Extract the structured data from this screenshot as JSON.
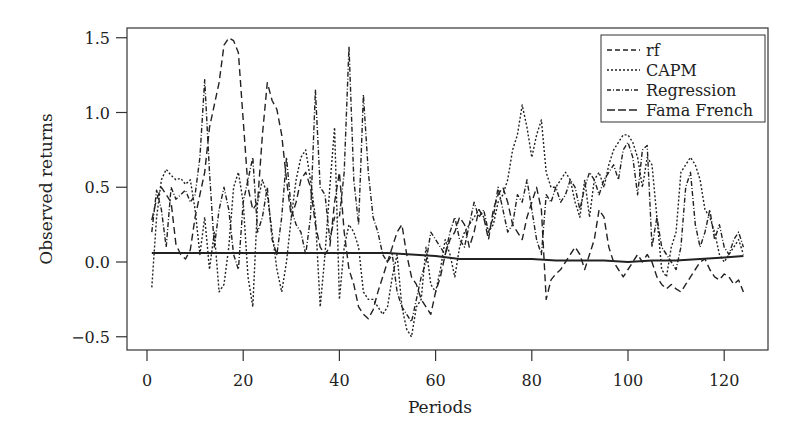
{
  "chart_data": {
    "type": "line",
    "title": "",
    "xlabel": "Periods",
    "ylabel": "Observed returns",
    "xlim": [
      -4,
      129
    ],
    "ylim": [
      -0.6,
      1.58
    ],
    "x_ticks": [
      0,
      20,
      40,
      60,
      80,
      100,
      120
    ],
    "x_tick_labels": [
      "0",
      "20",
      "40",
      "60",
      "80",
      "100",
      "120"
    ],
    "y_ticks": [
      -0.5,
      0.0,
      0.5,
      1.0,
      1.5
    ],
    "y_tick_labels": [
      "−0.5",
      "0.0",
      "0.5",
      "1.0",
      "1.5"
    ],
    "grid": false,
    "legend_position": "top-right",
    "series": [
      {
        "name": "rf",
        "dash": "7,4",
        "x": [
          1,
          2,
          3,
          4,
          5,
          6,
          7,
          8,
          9,
          10,
          11,
          12,
          13,
          14,
          15,
          16,
          17,
          18,
          19,
          20,
          21,
          22,
          23,
          24,
          25,
          26,
          27,
          28,
          29,
          30,
          31,
          32,
          33,
          34,
          35,
          36,
          37,
          38,
          39,
          40,
          41,
          42,
          43,
          44,
          45,
          46,
          47,
          48,
          49,
          50,
          51,
          52,
          53,
          54,
          55,
          56,
          57,
          58,
          59,
          60,
          61,
          62,
          63,
          64,
          65,
          66,
          67,
          68,
          69,
          70,
          71,
          72,
          73,
          74,
          75,
          76,
          77,
          78,
          79,
          80,
          81,
          82,
          83,
          84,
          85,
          86,
          87,
          88,
          89,
          90,
          91,
          92,
          93,
          94,
          95,
          96,
          97,
          98,
          99,
          100,
          101,
          102,
          103,
          104,
          105,
          106,
          107,
          108,
          109,
          110,
          111,
          112,
          113,
          114,
          115,
          116,
          117,
          118,
          119,
          120,
          121,
          122,
          123,
          124
        ],
        "values": [
          0.28,
          0.42,
          0.5,
          0.45,
          0.4,
          0.12,
          0.05,
          0.02,
          0.08,
          0.3,
          0.45,
          0.6,
          0.9,
          1.05,
          1.2,
          1.45,
          1.5,
          1.48,
          1.4,
          0.95,
          0.5,
          0.35,
          0.4,
          0.85,
          1.2,
          1.08,
          1.02,
          0.85,
          0.55,
          0.3,
          0.4,
          0.55,
          0.6,
          0.5,
          0.25,
          0.1,
          0.05,
          0.1,
          0.4,
          0.6,
          0.2,
          -0.05,
          -0.15,
          -0.3,
          -0.35,
          -0.38,
          -0.32,
          -0.2,
          -0.1,
          0.0,
          0.1,
          0.2,
          0.25,
          0.05,
          -0.1,
          -0.15,
          -0.25,
          -0.3,
          -0.35,
          -0.2,
          -0.1,
          0.05,
          0.15,
          0.2,
          0.3,
          0.25,
          0.1,
          0.2,
          0.35,
          0.3,
          0.15,
          0.35,
          0.45,
          0.5,
          0.4,
          0.25,
          0.2,
          0.15,
          0.3,
          0.4,
          0.5,
          0.35,
          -0.25,
          -0.12,
          -0.08,
          -0.05,
          0.0,
          0.05,
          0.1,
          0.05,
          -0.05,
          0.05,
          0.15,
          0.35,
          0.3,
          0.1,
          0.0,
          -0.05,
          -0.1,
          -0.05,
          0.0,
          0.05,
          0.0,
          0.05,
          0.0,
          -0.1,
          -0.15,
          -0.18,
          -0.15,
          -0.18,
          -0.2,
          -0.15,
          -0.1,
          -0.05,
          0.0,
          0.02,
          -0.05,
          -0.1,
          -0.12,
          -0.08,
          -0.1,
          -0.15,
          -0.12,
          -0.2
        ]
      },
      {
        "name": "CAPM",
        "dash": "2,2",
        "x": [
          1,
          2,
          3,
          4,
          5,
          6,
          7,
          8,
          9,
          10,
          11,
          12,
          13,
          14,
          15,
          16,
          17,
          18,
          19,
          20,
          21,
          22,
          23,
          24,
          25,
          26,
          27,
          28,
          29,
          30,
          31,
          32,
          33,
          34,
          35,
          36,
          37,
          38,
          39,
          40,
          41,
          42,
          43,
          44,
          45,
          46,
          47,
          48,
          49,
          50,
          51,
          52,
          53,
          54,
          55,
          56,
          57,
          58,
          59,
          60,
          61,
          62,
          63,
          64,
          65,
          66,
          67,
          68,
          69,
          70,
          71,
          72,
          73,
          74,
          75,
          76,
          77,
          78,
          79,
          80,
          81,
          82,
          83,
          84,
          85,
          86,
          87,
          88,
          89,
          90,
          91,
          92,
          93,
          94,
          95,
          96,
          97,
          98,
          99,
          100,
          101,
          102,
          103,
          104,
          105,
          106,
          107,
          108,
          109,
          110,
          111,
          112,
          113,
          114,
          115,
          116,
          117,
          118,
          119,
          120,
          121,
          122,
          123,
          124
        ],
        "values": [
          -0.17,
          0.3,
          0.55,
          0.62,
          0.58,
          0.55,
          0.56,
          0.52,
          0.55,
          0.35,
          0.05,
          0.3,
          -0.05,
          0.2,
          -0.2,
          -0.15,
          0.1,
          0.5,
          0.6,
          0.4,
          -0.1,
          -0.3,
          0.4,
          0.55,
          0.45,
          0.2,
          -0.05,
          -0.2,
          0.0,
          0.3,
          0.55,
          0.7,
          0.75,
          0.55,
          0.3,
          -0.3,
          0.05,
          0.5,
          0.9,
          -0.25,
          0.1,
          0.25,
          0.2,
          0.1,
          -0.2,
          -0.25,
          -0.25,
          -0.3,
          -0.35,
          -0.3,
          -0.1,
          0.05,
          -0.3,
          -0.45,
          -0.5,
          -0.3,
          -0.25,
          0.1,
          -0.15,
          -0.2,
          -0.05,
          0.15,
          0.05,
          -0.1,
          0.1,
          0.2,
          0.25,
          0.3,
          0.35,
          0.3,
          0.2,
          0.25,
          0.4,
          0.45,
          0.55,
          0.75,
          0.85,
          1.05,
          0.9,
          0.7,
          0.85,
          0.95,
          0.6,
          0.5,
          0.5,
          0.55,
          0.6,
          0.55,
          0.4,
          0.3,
          0.55,
          0.3,
          0.55,
          0.6,
          0.5,
          0.65,
          0.75,
          0.8,
          0.85,
          0.85,
          0.8,
          0.7,
          0.5,
          0.7,
          0.65,
          0.3,
          -0.05,
          -0.1,
          0.1,
          0.2,
          0.6,
          0.65,
          0.7,
          0.65,
          0.55,
          0.35,
          0.3,
          0.2,
          0.05,
          0.0,
          0.05,
          0.1,
          0.15,
          0.05
        ]
      },
      {
        "name": "Regression",
        "dash": "5,2,1,2",
        "x": [
          1,
          2,
          3,
          4,
          5,
          6,
          7,
          8,
          9,
          10,
          11,
          12,
          13,
          14,
          15,
          16,
          17,
          18,
          19,
          20,
          21,
          22,
          23,
          24,
          25,
          26,
          27,
          28,
          29,
          30,
          31,
          32,
          33,
          34,
          35,
          36,
          37,
          38,
          39,
          40,
          41,
          42,
          43,
          44,
          45,
          46,
          47,
          48,
          49,
          50,
          51,
          52,
          53,
          54,
          55,
          56,
          57,
          58,
          59,
          60,
          61,
          62,
          63,
          64,
          65,
          66,
          67,
          68,
          69,
          70,
          71,
          72,
          73,
          74,
          75,
          76,
          77,
          78,
          79,
          80,
          81,
          82,
          83,
          84,
          85,
          86,
          87,
          88,
          89,
          90,
          91,
          92,
          93,
          94,
          95,
          96,
          97,
          98,
          99,
          100,
          101,
          102,
          103,
          104,
          105,
          106,
          107,
          108,
          109,
          110,
          111,
          112,
          113,
          114,
          115,
          116,
          117,
          118,
          119,
          120,
          121,
          122,
          123,
          124
        ],
        "values": [
          0.2,
          0.48,
          0.35,
          0.1,
          0.5,
          0.42,
          0.45,
          0.48,
          0.4,
          0.45,
          0.7,
          1.22,
          0.6,
          0.1,
          0.35,
          0.5,
          0.35,
          0.05,
          -0.05,
          0.4,
          0.55,
          0.7,
          0.2,
          0.3,
          0.5,
          0.15,
          0.05,
          0.3,
          0.7,
          0.35,
          0.25,
          0.2,
          0.05,
          0.3,
          1.15,
          0.5,
          0.45,
          0.15,
          0.3,
          0.3,
          0.6,
          1.44,
          0.55,
          0.25,
          1.12,
          0.6,
          0.3,
          0.2,
          0.05,
          0.0,
          0.05,
          -0.2,
          -0.3,
          -0.35,
          -0.4,
          -0.25,
          -0.1,
          0.0,
          0.2,
          0.15,
          0.1,
          0.05,
          0.2,
          0.3,
          0.15,
          0.1,
          0.25,
          0.4,
          0.3,
          0.35,
          0.2,
          0.3,
          0.5,
          0.35,
          0.2,
          0.25,
          0.45,
          0.4,
          0.55,
          0.35,
          0.15,
          0.05,
          0.45,
          0.4,
          0.5,
          0.4,
          0.45,
          0.55,
          0.5,
          0.35,
          0.5,
          0.6,
          0.55,
          0.45,
          0.55,
          0.6,
          0.65,
          0.55,
          0.75,
          0.8,
          0.7,
          0.45,
          0.75,
          0.78,
          0.1,
          0.3,
          0.1,
          0.05,
          0.0,
          -0.05,
          0.1,
          0.5,
          0.6,
          0.25,
          0.1,
          0.2,
          0.35,
          0.15,
          0.25,
          0.1,
          0.05,
          0.15,
          0.2,
          0.1
        ]
      },
      {
        "name": "Fama French",
        "dash": "",
        "x": [
          1,
          5,
          10,
          15,
          20,
          25,
          30,
          35,
          40,
          45,
          50,
          55,
          60,
          65,
          70,
          75,
          80,
          85,
          90,
          95,
          100,
          105,
          110,
          115,
          120,
          124
        ],
        "values": [
          0.06,
          0.06,
          0.06,
          0.06,
          0.06,
          0.06,
          0.06,
          0.06,
          0.06,
          0.06,
          0.06,
          0.05,
          0.04,
          0.02,
          0.02,
          0.02,
          0.02,
          0.01,
          0.01,
          0.01,
          0.0,
          0.01,
          0.01,
          0.02,
          0.03,
          0.04
        ]
      }
    ]
  }
}
